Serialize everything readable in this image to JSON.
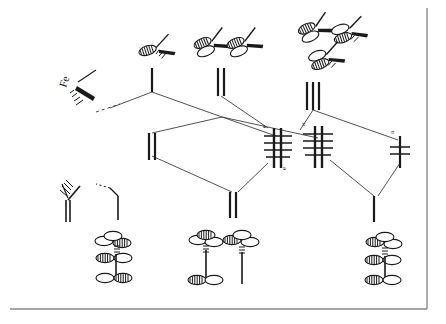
{
  "figure": {
    "kind": "molecular-orbital-correlation-diagram",
    "center_atom_label": "Fe",
    "ink_color": "#1a1a1a",
    "line_color": "#3a3a3a",
    "background_color": "#ffffff",
    "border_color": "#7a7a7a"
  },
  "labels": {
    "metal": "Fe",
    "level_e_left_upper": "e",
    "level_e_left_lower": "e",
    "level_a_middle": "a",
    "level_a_right": "a"
  },
  "levels": [
    {
      "id": "left-upper-single",
      "x": 152,
      "y": 75,
      "width": 1,
      "degeneracy": 1,
      "electrons": 0,
      "style": "single"
    },
    {
      "id": "mid-upper-double",
      "x": 221,
      "y": 77,
      "width": 1,
      "degeneracy": 2,
      "electrons": 0,
      "style": "double"
    },
    {
      "id": "right-upper-triple",
      "x": 313,
      "y": 92,
      "width": 1,
      "degeneracy": 3,
      "electrons": 0,
      "style": "triple"
    },
    {
      "id": "left-lower-double",
      "x": 152,
      "y": 140,
      "width": 1,
      "degeneracy": 2,
      "electrons": 0,
      "style": "double"
    },
    {
      "id": "bottom-mid-double",
      "x": 232,
      "y": 200,
      "width": 1,
      "degeneracy": 2,
      "electrons": 0,
      "style": "double"
    },
    {
      "id": "center-left-filled",
      "x": 278,
      "y": 148,
      "width": 1,
      "degeneracy": 3,
      "electrons": 6,
      "style": "filled-set",
      "label": "e"
    },
    {
      "id": "center-right-filled",
      "x": 318,
      "y": 146,
      "width": 1,
      "degeneracy": 3,
      "electrons": 6,
      "style": "filled-set",
      "label": "a"
    },
    {
      "id": "far-right-filled",
      "x": 400,
      "y": 150,
      "width": 1,
      "degeneracy": 1,
      "electrons": 2,
      "style": "filled-single",
      "label": "a"
    },
    {
      "id": "right-bottom-single",
      "x": 374,
      "y": 205,
      "width": 1,
      "degeneracy": 1,
      "electrons": 0,
      "style": "single"
    }
  ],
  "orbital_cartoons": {
    "top_row": [
      {
        "id": "top-left-single",
        "x": 158,
        "y": 45,
        "count": 1,
        "note": "single d-orbital sketch"
      },
      {
        "id": "top-mid-pair-a",
        "x": 212,
        "y": 40,
        "count": 1,
        "note": "d-orbital sketch"
      },
      {
        "id": "top-mid-pair-b",
        "x": 243,
        "y": 40,
        "count": 1,
        "note": "d-orbital sketch"
      },
      {
        "id": "top-right-a",
        "x": 318,
        "y": 25,
        "count": 1,
        "note": "d-orbital sketch"
      },
      {
        "id": "top-right-b",
        "x": 349,
        "y": 28,
        "count": 1,
        "note": "d-orbital sketch"
      },
      {
        "id": "top-right-c",
        "x": 327,
        "y": 54,
        "count": 1,
        "note": "d-orbital sketch"
      }
    ],
    "bottom_row": [
      {
        "id": "bottom-left-stack",
        "x": 118,
        "y": 262,
        "note": "three-lobe ligand group orbital"
      },
      {
        "id": "bottom-mid-stack-a",
        "x": 208,
        "y": 262,
        "note": "ligand group orbital"
      },
      {
        "id": "bottom-mid-stack-b",
        "x": 243,
        "y": 262,
        "note": "ligand group orbital"
      },
      {
        "id": "bottom-right-stack",
        "x": 388,
        "y": 262,
        "note": "three-lobe ligand group orbital"
      }
    ]
  },
  "fragment_sketches": [
    {
      "id": "metal-fragment",
      "x": 72,
      "y": 85,
      "label": "Fe",
      "note": "Fe with wedge and hash bonds"
    },
    {
      "id": "ligand-fragment-left",
      "x": 68,
      "y": 200,
      "label": "",
      "note": "hashed-bond fragment"
    },
    {
      "id": "ligand-fragment-right",
      "x": 110,
      "y": 200,
      "label": "",
      "note": "dashed-bond fragment"
    }
  ]
}
